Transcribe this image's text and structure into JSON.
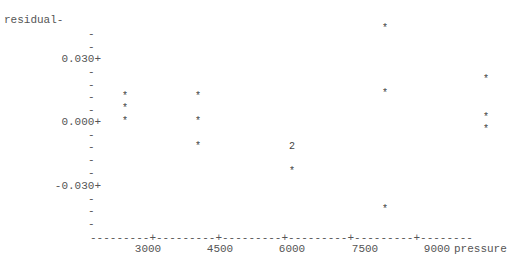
{
  "chart_data": {
    "type": "scatter",
    "title": "",
    "xlabel": "pressure",
    "ylabel": "residual",
    "x_ticks": [
      "3000",
      "4500",
      "6000",
      "7500",
      "9000"
    ],
    "y_ticks": [
      "0.030",
      "0.000",
      "-0.030"
    ],
    "ylim": [
      -0.048,
      0.048
    ],
    "xlim": [
      1950,
      10350
    ],
    "grid": false,
    "legend": "none",
    "marker": "*",
    "multi_point_marker": "2",
    "points": [
      {
        "x": 2520,
        "y": 0.012
      },
      {
        "x": 2520,
        "y": 0.006
      },
      {
        "x": 2520,
        "y": 0.0
      },
      {
        "x": 4040,
        "y": 0.012
      },
      {
        "x": 4040,
        "y": 0.0
      },
      {
        "x": 4040,
        "y": -0.012
      },
      {
        "x": 6000,
        "y": -0.012,
        "count": 2
      },
      {
        "x": 6000,
        "y": -0.024
      },
      {
        "x": 7900,
        "y": 0.042
      },
      {
        "x": 7900,
        "y": 0.012
      },
      {
        "x": 7900,
        "y": -0.042
      },
      {
        "x": 9990,
        "y": 0.018
      },
      {
        "x": 9990,
        "y": 0.002
      },
      {
        "x": 9990,
        "y": -0.006
      }
    ]
  },
  "axis": {
    "y_title": "residual-",
    "y_labels": [
      {
        "text": "0.030+",
        "top": 53
      },
      {
        "text": "0.000+",
        "top": 116
      },
      {
        "text": "-0.030+",
        "top": 180
      }
    ],
    "y_minor": [
      28,
      41,
      66,
      79,
      91,
      104,
      129,
      141,
      154,
      167,
      193,
      205,
      218
    ],
    "x_axis_line": "---------+---------+---------+---------+---------+--------",
    "x_title": "pressure",
    "x_labels": [
      {
        "text": "3000",
        "left": 148
      },
      {
        "text": "4500",
        "left": 220
      },
      {
        "text": "6000",
        "left": 292
      },
      {
        "text": "7500",
        "left": 365
      },
      {
        "text": "9000",
        "left": 437
      }
    ]
  },
  "marks": [
    {
      "m": "*",
      "x": 125,
      "y": 97
    },
    {
      "m": "*",
      "x": 125,
      "y": 109
    },
    {
      "m": "*",
      "x": 125,
      "y": 122
    },
    {
      "m": "*",
      "x": 198,
      "y": 97
    },
    {
      "m": "*",
      "x": 198,
      "y": 122
    },
    {
      "m": "*",
      "x": 198,
      "y": 147
    },
    {
      "m": "2",
      "x": 292,
      "y": 147
    },
    {
      "m": "*",
      "x": 292,
      "y": 172
    },
    {
      "m": "*",
      "x": 385,
      "y": 29
    },
    {
      "m": "*",
      "x": 385,
      "y": 94
    },
    {
      "m": "*",
      "x": 385,
      "y": 210
    },
    {
      "m": "*",
      "x": 486,
      "y": 80
    },
    {
      "m": "*",
      "x": 486,
      "y": 118
    },
    {
      "m": "*",
      "x": 486,
      "y": 130
    }
  ]
}
